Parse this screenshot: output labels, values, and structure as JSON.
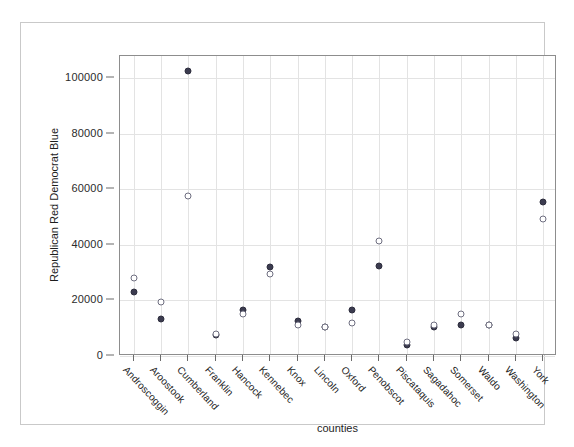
{
  "chart_data": {
    "type": "scatter",
    "title": "",
    "xlabel": "counties",
    "ylabel": "Republican Red Democrat Blue",
    "categories": [
      "Androscoggin",
      "Aroostook",
      "Cumberland",
      "Franklin",
      "Hancock",
      "Kennebec",
      "Knox",
      "Lincoln",
      "Oxford",
      "Penobscot",
      "Piscataquis",
      "Sagadahoc",
      "Somerset",
      "Waldo",
      "Washington",
      "York"
    ],
    "ylim": [
      0,
      108000
    ],
    "yticks": [
      0,
      20000,
      40000,
      60000,
      80000,
      100000
    ],
    "ytick_labels": [
      "0",
      "20000",
      "40000",
      "60000",
      "80000",
      "100000"
    ],
    "grid": true,
    "legend": "none",
    "series": [
      {
        "name": "Republican Red",
        "marker": "filled-circle",
        "color": "#3b3b4f",
        "values": [
          23000,
          13500,
          102500,
          7500,
          16500,
          32000,
          12500,
          10500,
          16500,
          32500,
          4000,
          10500,
          11000,
          11000,
          6500,
          55500
        ]
      },
      {
        "name": "Democrat Blue",
        "marker": "open-circle",
        "color": "#6e6e80",
        "values": [
          28000,
          19500,
          57500,
          7800,
          15000,
          29500,
          11000,
          10500,
          12000,
          41500,
          5000,
          11000,
          15000,
          11000,
          8000,
          49500
        ]
      }
    ]
  }
}
